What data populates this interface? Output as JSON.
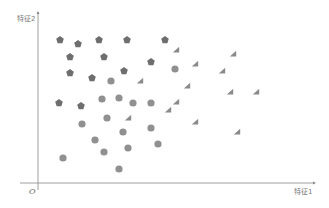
{
  "chart_data": {
    "type": "scatter",
    "title": "",
    "xlabel": "特征1",
    "ylabel": "特征2",
    "origin_label": "O",
    "grid": false,
    "legend": null,
    "axis_pixels": {
      "origin": [
        38,
        183
      ],
      "x_end": [
        313,
        183
      ],
      "y_end": [
        38,
        12
      ]
    },
    "colors": {
      "pentagon": "#6e6e6e",
      "circle": "#909090",
      "triangle": "#8a8a8a",
      "axis": "#888888"
    },
    "series": [
      {
        "name": "pentagon",
        "marker": "pentagon",
        "points": [
          [
            60,
            40
          ],
          [
            78,
            44
          ],
          [
            99,
            40
          ],
          [
            127,
            40
          ],
          [
            165,
            40
          ],
          [
            70,
            57
          ],
          [
            104,
            57
          ],
          [
            151,
            62
          ],
          [
            70,
            73
          ],
          [
            92,
            78
          ],
          [
            124,
            71
          ],
          [
            59,
            103
          ],
          [
            81,
            106
          ]
        ]
      },
      {
        "name": "circle",
        "marker": "circle",
        "points": [
          [
            111,
            81
          ],
          [
            175,
            69
          ],
          [
            102,
            99
          ],
          [
            119,
            98
          ],
          [
            133,
            103
          ],
          [
            151,
            103
          ],
          [
            82,
            124
          ],
          [
            107,
            118
          ],
          [
            123,
            132
          ],
          [
            151,
            128
          ],
          [
            95,
            140
          ],
          [
            104,
            152
          ],
          [
            128,
            148
          ],
          [
            158,
            144
          ],
          [
            63,
            158
          ],
          [
            119,
            169
          ]
        ]
      },
      {
        "name": "triangle",
        "marker": "triangle",
        "points": [
          [
            140,
            81
          ],
          [
            176,
            50
          ],
          [
            195,
            64
          ],
          [
            187,
            86
          ],
          [
            176,
            102
          ],
          [
            168,
            110
          ],
          [
            195,
            122
          ],
          [
            233,
            54
          ],
          [
            222,
            71
          ],
          [
            230,
            92
          ],
          [
            256,
            92
          ],
          [
            237,
            132
          ],
          [
            128,
            118
          ]
        ]
      }
    ]
  }
}
